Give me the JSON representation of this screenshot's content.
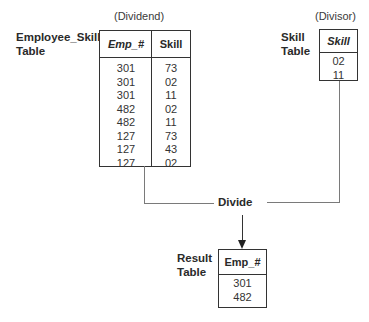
{
  "dividend": {
    "caption": "(Dividend)",
    "table_label": [
      "Employee_Skill",
      "Table"
    ],
    "columns": [
      "Emp_#",
      "Skill"
    ],
    "rows": [
      [
        "301",
        "73"
      ],
      [
        "301",
        "02"
      ],
      [
        "301",
        "11"
      ],
      [
        "482",
        "02"
      ],
      [
        "482",
        "11"
      ],
      [
        "127",
        "73"
      ],
      [
        "127",
        "43"
      ],
      [
        "127",
        "02"
      ]
    ]
  },
  "divisor": {
    "caption": "(Divisor)",
    "table_label": [
      "Skill",
      "Table"
    ],
    "columns": [
      "Skill"
    ],
    "rows": [
      [
        "02"
      ],
      [
        "11"
      ]
    ]
  },
  "operation": {
    "label": "Divide"
  },
  "result": {
    "table_label": [
      "Result",
      "Table"
    ],
    "columns": [
      "Emp_#"
    ],
    "rows": [
      [
        "301"
      ],
      [
        "482"
      ]
    ]
  }
}
